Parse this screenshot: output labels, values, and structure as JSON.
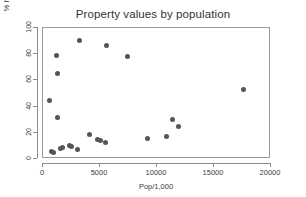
{
  "chart_data": {
    "type": "scatter",
    "title": "Property values by population",
    "xlabel": "Pop/1,000",
    "ylabel": "% homes cost $100K+",
    "xlim": [
      0,
      20000
    ],
    "ylim": [
      0,
      100
    ],
    "xticks": [
      0,
      5000,
      10000,
      15000,
      20000
    ],
    "xtick_labels": [
      "0",
      "5000",
      "10000",
      "15000",
      "20000"
    ],
    "yticks": [
      0,
      20,
      40,
      60,
      80,
      100
    ],
    "ytick_labels": [
      "0",
      "20",
      "40",
      "60",
      "80",
      "100"
    ],
    "grid": false,
    "legend": false,
    "marker_color": "#555555",
    "points": [
      {
        "x": 600,
        "y": 44.5
      },
      {
        "x": 750,
        "y": 5.5
      },
      {
        "x": 900,
        "y": 5.0
      },
      {
        "x": 1150,
        "y": 79.0
      },
      {
        "x": 1250,
        "y": 65.0
      },
      {
        "x": 1300,
        "y": 31.5
      },
      {
        "x": 1500,
        "y": 8.0
      },
      {
        "x": 1750,
        "y": 8.5
      },
      {
        "x": 2350,
        "y": 10.0
      },
      {
        "x": 2500,
        "y": 9.5
      },
      {
        "x": 3000,
        "y": 7.0
      },
      {
        "x": 3200,
        "y": 90.5
      },
      {
        "x": 4100,
        "y": 19.0
      },
      {
        "x": 4800,
        "y": 15.0
      },
      {
        "x": 5000,
        "y": 14.5
      },
      {
        "x": 5600,
        "y": 86.5
      },
      {
        "x": 5500,
        "y": 12.5
      },
      {
        "x": 7400,
        "y": 78.5
      },
      {
        "x": 9200,
        "y": 16.0
      },
      {
        "x": 10800,
        "y": 17.0
      },
      {
        "x": 11400,
        "y": 30.5
      },
      {
        "x": 11900,
        "y": 25.0
      },
      {
        "x": 17600,
        "y": 53.0
      }
    ]
  }
}
